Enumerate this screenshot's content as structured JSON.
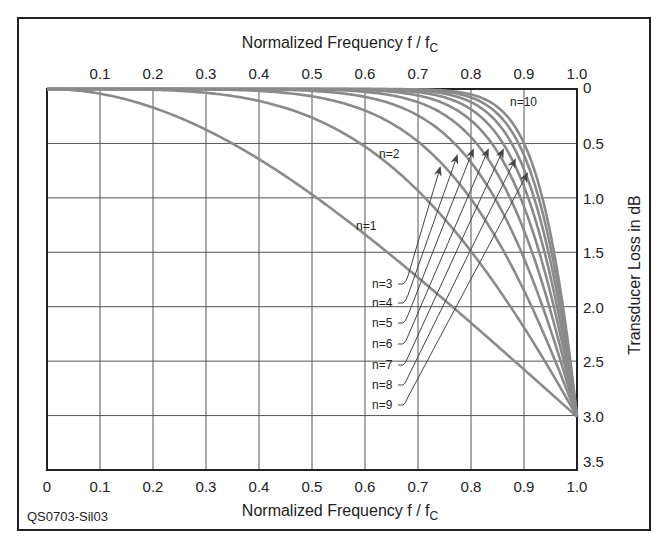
{
  "chart_data": {
    "type": "line",
    "title": "",
    "xlabel_top": "Normalized Frequency f / f",
    "xlabel_top_sub": "C",
    "xlabel_bottom": "Normalized Frequency f / f",
    "xlabel_bottom_sub": "C",
    "ylabel": "Transducer Loss in dB",
    "figure_id": "QS0703-Sil03",
    "xlim": [
      0,
      1.0
    ],
    "ylim": [
      0,
      3.5
    ],
    "y_inverted": true,
    "grid": true,
    "x_ticks_top": [
      "0.1",
      "0.2",
      "0.3",
      "0.4",
      "0.5",
      "0.6",
      "0.7",
      "0.8",
      "0.9",
      "1.0"
    ],
    "x_ticks_bottom": [
      "0",
      "0.1",
      "0.2",
      "0.3",
      "0.4",
      "0.5",
      "0.6",
      "0.7",
      "0.8",
      "0.9",
      "1.0"
    ],
    "y_ticks": [
      "0",
      "0.5",
      "1.0",
      "1.5",
      "2.0",
      "2.5",
      "3.0",
      "3.5"
    ],
    "x": [
      0,
      0.1,
      0.2,
      0.3,
      0.4,
      0.5,
      0.6,
      0.7,
      0.75,
      0.8,
      0.85,
      0.9,
      0.95,
      1.0
    ],
    "series": [
      {
        "name": "n=1",
        "values": [
          0,
          0.04,
          0.17,
          0.37,
          0.64,
          0.97,
          1.34,
          1.73,
          1.94,
          2.15,
          2.36,
          2.58,
          2.79,
          3.01
        ]
      },
      {
        "name": "n=2",
        "values": [
          0,
          0,
          0.01,
          0.04,
          0.11,
          0.26,
          0.53,
          0.92,
          1.19,
          1.48,
          1.82,
          2.18,
          2.58,
          3.01
        ]
      },
      {
        "name": "n=3",
        "values": [
          0,
          0,
          0,
          0,
          0.02,
          0.07,
          0.2,
          0.48,
          0.7,
          0.99,
          1.35,
          1.79,
          2.34,
          3.01
        ]
      },
      {
        "name": "n=4",
        "values": [
          0,
          0,
          0,
          0,
          0,
          0.02,
          0.07,
          0.24,
          0.41,
          0.65,
          1.0,
          1.47,
          2.15,
          3.01
        ]
      },
      {
        "name": "n=5",
        "values": [
          0,
          0,
          0,
          0,
          0,
          0,
          0.03,
          0.12,
          0.23,
          0.42,
          0.74,
          1.21,
          1.97,
          3.01
        ]
      },
      {
        "name": "n=6",
        "values": [
          0,
          0,
          0,
          0,
          0,
          0,
          0.01,
          0.06,
          0.13,
          0.27,
          0.53,
          0.99,
          1.81,
          3.01
        ]
      },
      {
        "name": "n=7",
        "values": [
          0,
          0,
          0,
          0,
          0,
          0,
          0,
          0.03,
          0.08,
          0.18,
          0.38,
          0.81,
          1.67,
          3.01
        ]
      },
      {
        "name": "n=8",
        "values": [
          0,
          0,
          0,
          0,
          0,
          0,
          0,
          0.01,
          0.04,
          0.12,
          0.27,
          0.66,
          1.53,
          3.01
        ]
      },
      {
        "name": "n=9",
        "values": [
          0,
          0,
          0,
          0,
          0,
          0,
          0,
          0.01,
          0.02,
          0.07,
          0.19,
          0.54,
          1.4,
          3.01
        ]
      },
      {
        "name": "n=10",
        "values": [
          0,
          0,
          0,
          0,
          0,
          0,
          0,
          0,
          0.01,
          0.05,
          0.14,
          0.44,
          1.29,
          3.01
        ]
      }
    ],
    "annotations": [
      "n=1",
      "n=2",
      "n=3",
      "n=4",
      "n=5",
      "n=6",
      "n=7",
      "n=8",
      "n=9",
      "n=10"
    ],
    "legend": "none (inline curve labels)",
    "colors": {
      "curves": "#8a8a8a",
      "grid": "#555555",
      "frame": "#222222",
      "text": "#222222"
    }
  }
}
